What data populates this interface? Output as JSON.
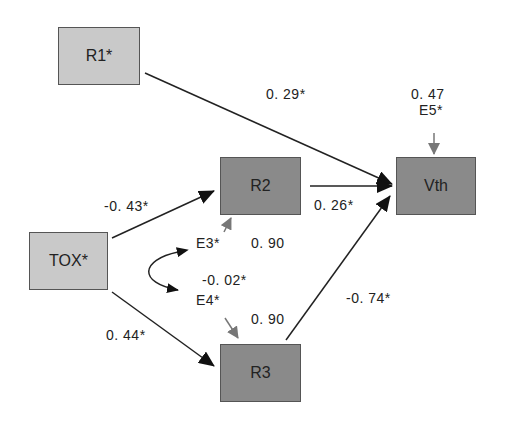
{
  "nodes": {
    "r1": {
      "label": "R1*"
    },
    "r2": {
      "label": "R2"
    },
    "vth": {
      "label": "Vth"
    },
    "tox": {
      "label": "TOX*"
    },
    "r3": {
      "label": "R3"
    }
  },
  "paths": {
    "r1_vth": "0. 29*",
    "r2_vth": "0. 26*",
    "r3_vth": "-0. 74*",
    "tox_r2": "-0. 43*",
    "tox_r3": "0. 44*",
    "e3_e4_cov": "-0. 02*"
  },
  "errors": {
    "e3": {
      "label": "E3*",
      "value": "0. 90"
    },
    "e4": {
      "label": "E4*",
      "value": "0. 90"
    },
    "e5": {
      "label": "E5*",
      "value": "0. 47"
    }
  },
  "colors": {
    "exogenous_fill": "#c9c9c9",
    "endogenous_fill": "#8a8a8a",
    "arrow": "#222222",
    "error_arrow": "#777777"
  }
}
